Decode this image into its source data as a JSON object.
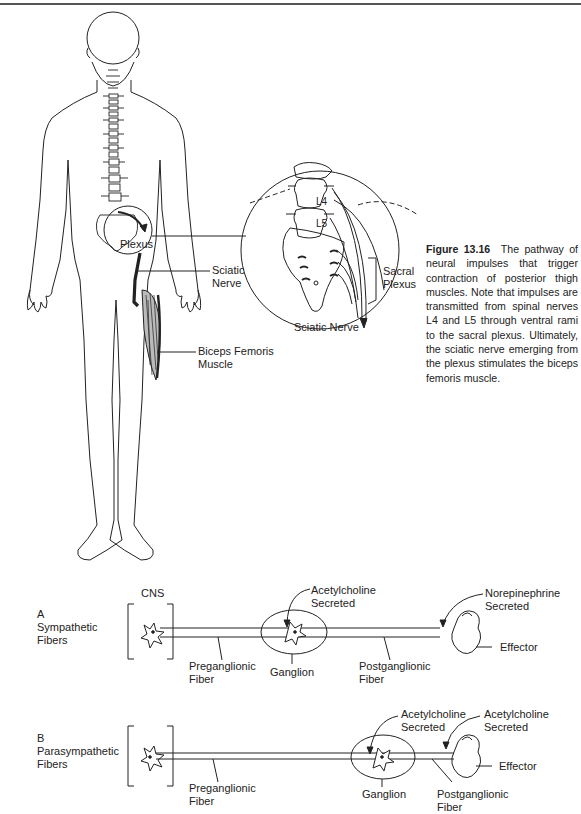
{
  "figure": {
    "number": "Figure 13.16",
    "caption": "The pathway of neural impulses that trigger contraction of posterior thigh muscles. Note that impulses are transmitted from spinal nerves L4 and L5 through ventral rami to the sacral plexus. Ultimately, the sciatic nerve emerging from the plexus stimulates the biceps femoris muscle."
  },
  "body_diagram": {
    "labels": {
      "plexus": "Plexus",
      "sciatic_nerve_1": "Sciatic",
      "sciatic_nerve_2": "Nerve",
      "biceps_1": "Biceps Femoris",
      "biceps_2": "Muscle"
    }
  },
  "inset": {
    "labels": {
      "l4": "L4",
      "l5": "L5",
      "sacral_1": "Sacral",
      "sacral_2": "Plexus",
      "sciatic": "Sciatic Nerve"
    }
  },
  "pathway_a": {
    "letter": "A",
    "title_1": "Sympathetic",
    "title_2": "Fibers",
    "cns": "CNS",
    "ach_1": "Acetylcholine",
    "ach_2": "Secreted",
    "ne_1": "Norepinephrine",
    "ne_2": "Secreted",
    "pre_1": "Preganglionic",
    "pre_2": "Fiber",
    "ganglion": "Ganglion",
    "post_1": "Postganglionic",
    "post_2": "Fiber",
    "effector": "Effector"
  },
  "pathway_b": {
    "letter": "B",
    "title_1": "Parasympathetic",
    "title_2": "Fibers",
    "ach1_1": "Acetylcholine",
    "ach1_2": "Secreted",
    "ach2_1": "Acetylcholine",
    "ach2_2": "Secreted",
    "pre_1": "Preganglionic",
    "pre_2": "Fiber",
    "ganglion": "Ganglion",
    "post_1": "Postganglionic",
    "post_2": "Fiber",
    "effector": "Effector"
  }
}
